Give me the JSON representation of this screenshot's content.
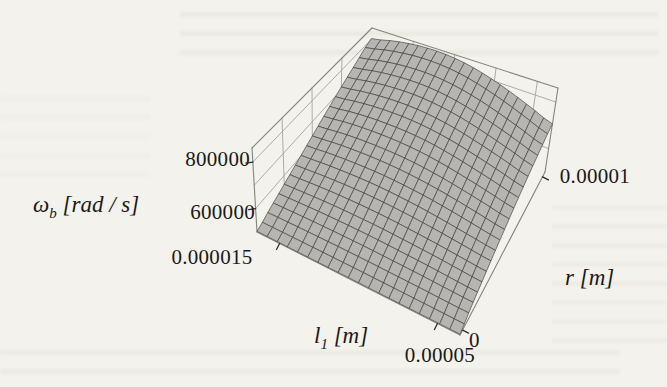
{
  "page": {
    "background": "#f4f2ec"
  },
  "chart_data": {
    "type": "surface3d",
    "title": "",
    "x_axis": {
      "symbol": "l",
      "symbol_sub": "1",
      "unit": "[m]",
      "ticks": [
        "0.000015",
        "0.00005"
      ],
      "tick_fracs": [
        0.111,
        0.889
      ],
      "grid_fracs": [
        0.222,
        0.444,
        0.667,
        0.889
      ],
      "range": [
        1e-05,
        5.5e-05
      ]
    },
    "y_axis": {
      "symbol": "r",
      "unit": "[m]",
      "ticks": [
        "0",
        "0.00001"
      ],
      "tick_fracs": [
        0.03,
        0.97
      ],
      "grid_fracs": [
        0.25,
        0.5,
        0.75
      ],
      "range": [
        0,
        1e-05
      ]
    },
    "z_axis": {
      "symbol": "ω",
      "symbol_sub": "b",
      "unit": "[rad / s]",
      "ticks": [
        "600000",
        "800000"
      ],
      "tick_fracs": [
        0.278,
        0.833
      ],
      "grid_fracs": [
        0.278,
        0.556,
        0.833
      ],
      "range": [
        500000,
        860000
      ]
    },
    "surface": {
      "mesh_cells": 20,
      "fill": "#b6b5b1",
      "line": "#3e3e3a",
      "box_line": "#84847c",
      "tick_line": "#2b2b2b",
      "omega_grid_rows_r0_to_rmax": [
        [
          503000,
          503000,
          503000,
          503000,
          503000,
          503000,
          503000,
          503000,
          503000
        ],
        [
          532000,
          534000,
          535000,
          535000,
          534000,
          532000,
          530000,
          527000,
          525000
        ],
        [
          562000,
          567000,
          570000,
          570000,
          568000,
          563000,
          558000,
          551000,
          545000
        ],
        [
          596000,
          604000,
          609000,
          610000,
          606000,
          599000,
          589000,
          578000,
          568000
        ],
        [
          633000,
          645000,
          651000,
          652000,
          647000,
          637000,
          623000,
          607000,
          592000
        ],
        [
          673000,
          689000,
          697000,
          698000,
          692000,
          678000,
          659000,
          639000,
          619000
        ],
        [
          715000,
          734000,
          745000,
          747000,
          738000,
          721000,
          697000,
          672000,
          647000
        ],
        [
          759000,
          782000,
          795000,
          797000,
          786000,
          765000,
          737000,
          706000,
          676000
        ],
        [
          804000,
          831000,
          847000,
          849000,
          837000,
          812000,
          779000,
          742000,
          706000
        ]
      ]
    }
  }
}
